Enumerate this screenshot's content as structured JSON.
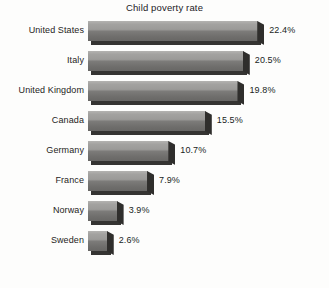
{
  "chart_data": {
    "type": "bar",
    "orientation": "horizontal",
    "title": "Child poverty rate",
    "xlabel": "",
    "ylabel": "",
    "value_suffix": "%",
    "grid": false,
    "legend": false,
    "xlim": [
      0,
      22.4
    ],
    "categories": [
      "United States",
      "Italy",
      "United Kingdom",
      "Canada",
      "Germany",
      "France",
      "Norway",
      "Sweden"
    ],
    "values": [
      22.4,
      20.5,
      19.8,
      15.5,
      10.7,
      7.9,
      3.9,
      2.6
    ],
    "value_labels": [
      "22.4%",
      "20.5%",
      "19.8%",
      "15.5%",
      "10.7%",
      "7.9%",
      "3.9%",
      "2.6%"
    ],
    "bars": [
      {
        "category": "United States",
        "value": 22.4,
        "label": "22.4%"
      },
      {
        "category": "Italy",
        "value": 20.5,
        "label": "20.5%"
      },
      {
        "category": "United Kingdom",
        "value": 19.8,
        "label": "19.8%"
      },
      {
        "category": "Canada",
        "value": 15.5,
        "label": "15.5%"
      },
      {
        "category": "Germany",
        "value": 10.7,
        "label": "10.7%"
      },
      {
        "category": "France",
        "value": 7.9,
        "label": "7.9%"
      },
      {
        "category": "Norway",
        "value": 3.9,
        "label": "3.9%"
      },
      {
        "category": "Sweden",
        "value": 2.6,
        "label": "2.6%"
      }
    ],
    "colors": {
      "bar_top": "#b4b3b1",
      "bar_bottom": "#68676 5",
      "bar_shadow": "#353432",
      "bar_cap": "#2f2e2c",
      "text": "#23211f",
      "background": "#fdfdfc"
    }
  },
  "layout": {
    "bar_origin_x": 88,
    "row_pitch": 30,
    "bar_height": 20,
    "px_per_unit": 7.6,
    "value_gap": 11
  }
}
